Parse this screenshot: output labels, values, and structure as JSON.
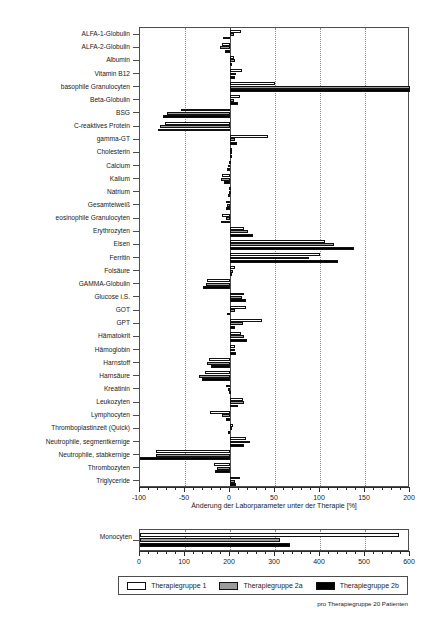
{
  "chart_data": {
    "type": "bar",
    "orientation": "horizontal",
    "title": "",
    "xlabel": "Änderung der Laborparameter unter der Therapie [%]",
    "ylabel": "",
    "xlim": [
      -100,
      200
    ],
    "xticks": [
      -100,
      -50,
      0,
      50,
      100,
      150,
      200
    ],
    "grid": true,
    "gridlines_x": [
      -50,
      50,
      100,
      150
    ],
    "legend_position": "bottom",
    "footnote": "pro Therapiegruppe 20 Patienten",
    "series": [
      {
        "name": "Therapiegruppe 1",
        "color": "#ffffff"
      },
      {
        "name": "Therapiegruppe 2a",
        "color": "#9b9b9b"
      },
      {
        "name": "Therapiegruppe 2b",
        "color": "#000000"
      }
    ],
    "categories": [
      "ALFA-1-Globulin",
      "ALFA-2-Globulin",
      "Albumin",
      "Vitamin B12",
      "basophile Granulocyten",
      "Beta-Globulin",
      "BSG",
      "C-reaktives Protein",
      "gamma-GT",
      "Cholesterin",
      "Calcium",
      "Kalium",
      "Natrium",
      "Gesamteiweiß",
      "eosinophile Granulocyten",
      "Erythrozyten",
      "Eisen",
      "Ferritin",
      "Folsäure",
      "GAMMA-Globulin",
      "Glucose i.S.",
      "GOT",
      "GPT",
      "Hämatokrit",
      "Hämoglobin",
      "Harnstoff",
      "Harnsäure",
      "Kreatinin",
      "Leukozyten",
      "Lymphocyten",
      "Thromboplastinzeit (Quick)",
      "Neutrophile, segmentkernige",
      "Neutrophile, stabkernige",
      "Thrombozyten",
      "Triglyceride"
    ],
    "values": {
      "Therapiegruppe 1": [
        12,
        -9,
        4,
        13,
        50,
        11,
        -55,
        -72,
        42,
        2,
        -1,
        -9,
        -1,
        -4,
        -9,
        16,
        105,
        100,
        5,
        -26,
        16,
        18,
        36,
        12,
        5,
        -23,
        -28,
        -4,
        14,
        -22,
        3,
        18,
        -82,
        -18,
        11
      ],
      "Therapiegruppe 2a": [
        4,
        -11,
        5,
        7,
        200,
        4,
        -70,
        -78,
        6,
        1,
        -2,
        -10,
        -1,
        -3,
        -4,
        20,
        115,
        88,
        3,
        -27,
        13,
        5,
        14,
        15,
        6,
        -26,
        -35,
        -2,
        16,
        -9,
        2,
        22,
        -82,
        -14,
        6
      ],
      "Therapiegruppe 2b": [
        -8,
        -6,
        2,
        6,
        200,
        9,
        -74,
        -80,
        8,
        1,
        -3,
        -7,
        -2,
        -5,
        -10,
        26,
        138,
        120,
        2,
        -30,
        18,
        -3,
        5,
        19,
        7,
        -21,
        -31,
        -1,
        9,
        -5,
        -2,
        16,
        -100,
        -17,
        7
      ]
    }
  },
  "mono_chart": {
    "type": "bar",
    "orientation": "horizontal",
    "categories": [
      "Monocyten"
    ],
    "xlim": [
      0,
      600
    ],
    "xticks": [
      0,
      100,
      200,
      300,
      400,
      500,
      600
    ],
    "gridlines_x": [
      100,
      200,
      300,
      400,
      500
    ],
    "values": {
      "Therapiegruppe 1": [
        575
      ],
      "Therapiegruppe 2a": [
        310
      ],
      "Therapiegruppe 2b": [
        333
      ]
    }
  }
}
